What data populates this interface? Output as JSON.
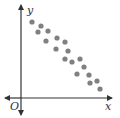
{
  "chart_data": {
    "type": "scatter",
    "title": "",
    "xlabel": "x",
    "ylabel": "y",
    "origin_label": "O",
    "grid": false,
    "legend": null,
    "trend": "negative linear correlation",
    "points_px": [
      [
        32,
        22
      ],
      [
        41,
        26
      ],
      [
        38,
        32
      ],
      [
        48,
        31
      ],
      [
        46,
        41
      ],
      [
        57,
        38
      ],
      [
        65,
        42
      ],
      [
        56,
        49
      ],
      [
        68,
        51
      ],
      [
        65,
        59
      ],
      [
        72,
        62
      ],
      [
        80,
        59
      ],
      [
        84,
        67
      ],
      [
        77,
        74
      ],
      [
        89,
        75
      ],
      [
        97,
        81
      ],
      [
        90,
        83
      ],
      [
        100,
        89
      ]
    ],
    "colors": {
      "axis": "#333333",
      "point": "#808080"
    }
  }
}
